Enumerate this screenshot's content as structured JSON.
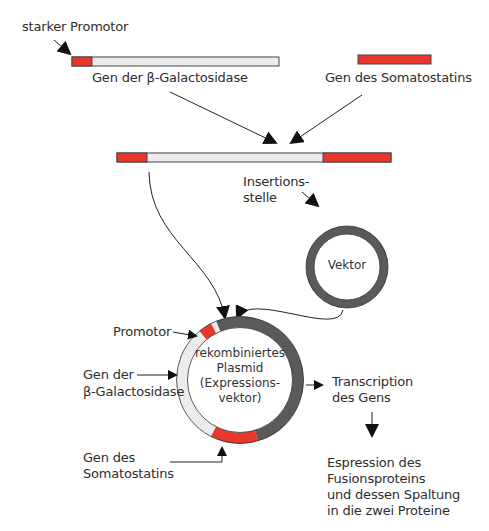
{
  "colors": {
    "promoter_red": "#e8372c",
    "gene_gray_fill": "#ececec",
    "vector_dark": "#5a5a5a",
    "outline": "#333333",
    "text": "#2e2e2e"
  },
  "labels": {
    "strong_promoter": "starker Promotor",
    "beta_gal_gene": "Gen der β-Galactosidase",
    "somatostatin_gene": "Gen des Somatostatins",
    "insertion_site_line1": "Insertions-",
    "insertion_site_line2": "stelle",
    "vector": "Vektor",
    "plasmid_line1": "rekombiniertes",
    "plasmid_line2": "Plasmid",
    "plasmid_line3": "(Expressions-",
    "plasmid_line4": "vektor)",
    "promoter": "Promotor",
    "beta_gal_line1": "Gen der",
    "beta_gal_line2": "β-Galactosidase",
    "somatostatin_line1": "Gen des",
    "somatostatin_line2": "Somatostatins",
    "transcription_line1": "Transcription",
    "transcription_line2": "des Gens",
    "expression_line1": "Espression des",
    "expression_line2": "Fusionsproteins",
    "expression_line3": "und dessen Spaltung",
    "expression_line4": "in die zwei Proteine"
  }
}
